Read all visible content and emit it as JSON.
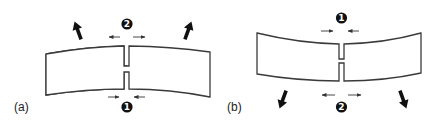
{
  "figure": {
    "panels": [
      {
        "id": "a",
        "label": "(a)",
        "curvature": "concave-up (ends bent upward)",
        "end_force_direction": "up-outward",
        "markers": [
          {
            "number": "2",
            "position": "top",
            "arrows": "outward (opening)"
          },
          {
            "number": "1",
            "position": "bottom",
            "arrows": "inward (closing)"
          }
        ]
      },
      {
        "id": "b",
        "label": "(b)",
        "curvature": "concave-up shape with ends pulled downward",
        "end_force_direction": "down-outward",
        "markers": [
          {
            "number": "1",
            "position": "top",
            "arrows": "inward (closing)"
          },
          {
            "number": "2",
            "position": "bottom",
            "arrows": "outward (opening)"
          }
        ]
      }
    ]
  },
  "labels": {
    "panel_a": "(a)",
    "panel_b": "(b)",
    "a_top_marker": "2",
    "a_bottom_marker": "1",
    "b_top_marker": "1",
    "b_bottom_marker": "2"
  },
  "colors": {
    "outline": "#3a3a3a",
    "arrow": "#111111",
    "badge_fill": "#111111",
    "badge_text": "#ffffff",
    "background": "#ffffff"
  }
}
